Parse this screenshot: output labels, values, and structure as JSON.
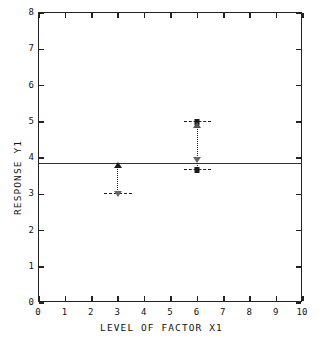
{
  "chart_data": {
    "type": "scatter",
    "title": "",
    "xlabel": "LEVEL OF FACTOR X1",
    "ylabel": "RESPONSE Y1",
    "xlim": [
      0,
      10
    ],
    "ylim": [
      0,
      8
    ],
    "xticks": [
      0,
      1,
      2,
      3,
      4,
      5,
      6,
      7,
      8,
      9,
      10
    ],
    "xtick_labels": [
      "0",
      "1",
      "2",
      "3",
      "4",
      "5",
      "6",
      "7",
      "8",
      "9",
      "10"
    ],
    "yticks": [
      0,
      1,
      2,
      3,
      4,
      5,
      6,
      7,
      8
    ],
    "ytick_labels": [
      "0",
      "1",
      "2",
      "3",
      "4",
      "5",
      "6",
      "7",
      "8"
    ],
    "grid": false,
    "legend": "none",
    "reference_line": {
      "orientation": "horizontal",
      "y": 3.85,
      "style": "solid",
      "label": "grand mean"
    },
    "groups": [
      {
        "name": "level-3",
        "x": 3,
        "connector_style": "dotted",
        "connector_from": 3.0,
        "connector_to": 3.82,
        "points": [
          {
            "y": 3.82,
            "marker": "triangle-up",
            "filled": true,
            "bar": false
          },
          {
            "y": 3.0,
            "marker": "triangle-down-open",
            "filled": false,
            "bar": true,
            "bar_width": 1.05
          }
        ]
      },
      {
        "name": "level-6",
        "x": 6,
        "connector_style": "dotted",
        "connector_from": 3.68,
        "connector_to": 5.0,
        "points": [
          {
            "y": 5.0,
            "marker": "square-filled",
            "filled": true,
            "bar": true,
            "bar_width": 1.05
          },
          {
            "y": 4.9,
            "marker": "triangle-up-open",
            "filled": false,
            "bar": false
          },
          {
            "y": 3.95,
            "marker": "triangle-down-open",
            "filled": false,
            "bar": false
          },
          {
            "y": 3.68,
            "marker": "square-filled",
            "filled": true,
            "bar": true,
            "bar_width": 1.05
          }
        ]
      }
    ]
  },
  "axis_titles": {
    "x": "LEVEL OF FACTOR X1",
    "y": "RESPONSE Y1"
  }
}
